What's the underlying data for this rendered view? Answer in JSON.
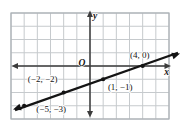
{
  "figure": {
    "background_color": "#ffffff",
    "grid_color": "#c6cacd",
    "frame_color": "#aab0b5",
    "axis_color": "#3b3b3b",
    "line_color": "#141414",
    "text_color": "#141414"
  },
  "chart_data": {
    "type": "line",
    "title": "",
    "xlabel": "x",
    "ylabel": "y",
    "origin_label": "O",
    "xlim": [
      -6,
      6
    ],
    "ylim": [
      -4,
      4
    ],
    "grid": true,
    "slope": "1/3",
    "points": [
      {
        "x": -5,
        "y": -3,
        "label": "(−5, −3)",
        "label_dx": 27,
        "label_dy": 3.5
      },
      {
        "x": -2,
        "y": -2,
        "label": "(−2, −2)",
        "label_dx": -21,
        "label_dy": -14
      },
      {
        "x": 1,
        "y": -1,
        "label": "(1, −1)",
        "label_dx": 17,
        "label_dy": 7.5
      },
      {
        "x": 4,
        "y": 0,
        "label": "(4, 0)",
        "label_dx": -3,
        "label_dy": -11.5
      }
    ],
    "line_extent_px": {
      "x_left": 13,
      "x_right": 180
    },
    "layout": {
      "width": 184,
      "height": 123,
      "plot": {
        "left": 11,
        "top": 13,
        "right": 169,
        "bottom": 119
      },
      "axis_label_pos": {
        "x": [
          166.5,
          72
        ],
        "y": [
          95,
          16
        ],
        "origin": [
          82,
          62.5
        ]
      },
      "x_axis_span": [
        11.5,
        171
      ],
      "y_axis_span": [
        10.5,
        117.5
      ]
    }
  }
}
